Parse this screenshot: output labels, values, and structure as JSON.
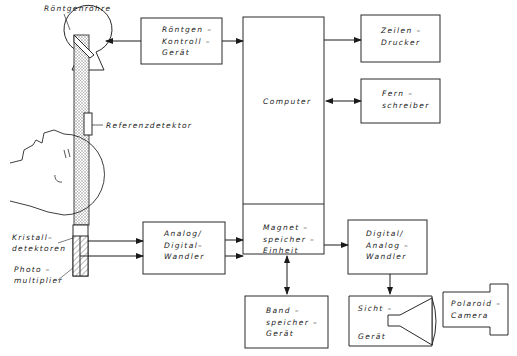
{
  "diagram": {
    "type": "CT scanner block diagram",
    "labels": {
      "tube": "Röntgenröhre",
      "reference": "Referenzdetektor",
      "crystal": "Kristall–\ndetektoren",
      "photo": "Photo –\nmultiplier"
    },
    "boxes": {
      "xray_control": "Röntgen –\nKontroll –\nGerät",
      "computer": "Computer",
      "line_printer": "Zeilen –\nDrucker",
      "teleprinter": "Fern –\nschreiber",
      "adc": "Analog/\nDigital–\nWandler",
      "magnetic": "Magnet –\nspeicher –\nEinheit",
      "dac": "Digital/\nAnalog –\nWandler",
      "tape": "Band –\nspeicher –\nGerät",
      "display_top": "Sicht –",
      "display_bottom": "Gerät",
      "polaroid": "Polaroid –\nCamera"
    },
    "colors": {
      "line": "#2a2a2a",
      "fill": "#ffffff"
    }
  }
}
